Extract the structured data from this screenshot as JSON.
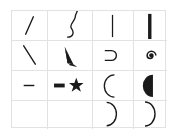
{
  "grid": {
    "rows": 4,
    "cols": 4,
    "line_color": "#e2e2e2",
    "stroke_color": "#1a1a1a",
    "cells": [
      {
        "row": 0,
        "col": 0,
        "glyph": "thin-diagonal-line-rising"
      },
      {
        "row": 0,
        "col": 1,
        "glyph": "wavy-s-curve"
      },
      {
        "row": 0,
        "col": 2,
        "glyph": "thin-vertical-line"
      },
      {
        "row": 0,
        "col": 3,
        "glyph": "thick-vertical-bar"
      },
      {
        "row": 1,
        "col": 0,
        "glyph": "thin-diagonal-line-falling"
      },
      {
        "row": 1,
        "col": 1,
        "glyph": "filled-wedge"
      },
      {
        "row": 1,
        "col": 2,
        "glyph": "right-open-cup"
      },
      {
        "row": 1,
        "col": 3,
        "glyph": "spiral"
      },
      {
        "row": 2,
        "col": 0,
        "glyph": "short-horizontal-dash"
      },
      {
        "row": 2,
        "col": 1,
        "glyph": "thick-dash-with-star"
      },
      {
        "row": 2,
        "col": 2,
        "glyph": "left-arc"
      },
      {
        "row": 2,
        "col": 3,
        "glyph": "filled-half-circle"
      },
      {
        "row": 3,
        "col": 0,
        "glyph": "empty"
      },
      {
        "row": 3,
        "col": 1,
        "glyph": "empty"
      },
      {
        "row": 3,
        "col": 2,
        "glyph": "right-arc"
      },
      {
        "row": 3,
        "col": 3,
        "glyph": "right-arc"
      }
    ]
  }
}
